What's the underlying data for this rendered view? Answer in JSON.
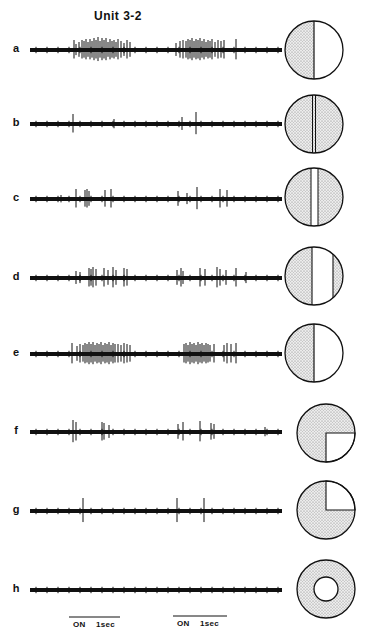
{
  "figure": {
    "title": "Unit 3-2",
    "colors": {
      "ink": "#111111",
      "stipple": "#c9c9c9",
      "background": "#ffffff"
    },
    "rows": [
      {
        "label": "a",
        "y": 50,
        "stimulus": "half-left-shaded",
        "spikes": [
          [
            74,
            10
          ],
          [
            76,
            6
          ],
          [
            79,
            8
          ],
          [
            82,
            10
          ],
          [
            84,
            9
          ],
          [
            86,
            11
          ],
          [
            88,
            8
          ],
          [
            90,
            11
          ],
          [
            92,
            9
          ],
          [
            94,
            12
          ],
          [
            96,
            10
          ],
          [
            98,
            13
          ],
          [
            100,
            9
          ],
          [
            102,
            12
          ],
          [
            104,
            10
          ],
          [
            106,
            12
          ],
          [
            108,
            8
          ],
          [
            110,
            11
          ],
          [
            112,
            9
          ],
          [
            114,
            10
          ],
          [
            116,
            8
          ],
          [
            118,
            11
          ],
          [
            121,
            9
          ],
          [
            124,
            7
          ],
          [
            127,
            10
          ],
          [
            130,
            8
          ],
          [
            176,
            7
          ],
          [
            180,
            9
          ],
          [
            183,
            10
          ],
          [
            186,
            9
          ],
          [
            188,
            11
          ],
          [
            190,
            10
          ],
          [
            192,
            12
          ],
          [
            194,
            9
          ],
          [
            196,
            11
          ],
          [
            198,
            10
          ],
          [
            200,
            12
          ],
          [
            202,
            9
          ],
          [
            204,
            11
          ],
          [
            206,
            8
          ],
          [
            208,
            10
          ],
          [
            210,
            9
          ],
          [
            212,
            11
          ],
          [
            215,
            8
          ],
          [
            218,
            10
          ],
          [
            221,
            9
          ],
          [
            224,
            10
          ],
          [
            236,
            11
          ]
        ]
      },
      {
        "label": "b",
        "y": 124,
        "stimulus": "two-lines-shaded",
        "spikes": [
          [
            73,
            10
          ],
          [
            114,
            5
          ],
          [
            182,
            7
          ],
          [
            196,
            12
          ]
        ]
      },
      {
        "label": "c",
        "y": 199,
        "stimulus": "narrow-white-slit",
        "spikes": [
          [
            61,
            4
          ],
          [
            76,
            10
          ],
          [
            85,
            9
          ],
          [
            87,
            10
          ],
          [
            89,
            8
          ],
          [
            105,
            9
          ],
          [
            111,
            10
          ],
          [
            178,
            8
          ],
          [
            187,
            6
          ],
          [
            197,
            12
          ],
          [
            220,
            10
          ],
          [
            227,
            9
          ]
        ]
      },
      {
        "label": "d",
        "y": 278,
        "stimulus": "wide-white-slit",
        "spikes": [
          [
            76,
            7
          ],
          [
            80,
            6
          ],
          [
            89,
            10
          ],
          [
            91,
            9
          ],
          [
            93,
            11
          ],
          [
            96,
            9
          ],
          [
            104,
            10
          ],
          [
            108,
            8
          ],
          [
            113,
            11
          ],
          [
            116,
            8
          ],
          [
            124,
            10
          ],
          [
            127,
            9
          ],
          [
            177,
            8
          ],
          [
            181,
            10
          ],
          [
            183,
            7
          ],
          [
            200,
            10
          ],
          [
            205,
            9
          ],
          [
            217,
            11
          ],
          [
            220,
            9
          ],
          [
            226,
            8
          ],
          [
            236,
            10
          ],
          [
            246,
            6
          ]
        ]
      },
      {
        "label": "e",
        "y": 354,
        "stimulus": "half-left-shaded",
        "spikes": [
          [
            72,
            11
          ],
          [
            77,
            8
          ],
          [
            80,
            10
          ],
          [
            83,
            9
          ],
          [
            85,
            11
          ],
          [
            87,
            10
          ],
          [
            89,
            12
          ],
          [
            91,
            10
          ],
          [
            93,
            12
          ],
          [
            95,
            9
          ],
          [
            97,
            11
          ],
          [
            99,
            10
          ],
          [
            101,
            12
          ],
          [
            103,
            9
          ],
          [
            105,
            11
          ],
          [
            107,
            10
          ],
          [
            109,
            12
          ],
          [
            111,
            9
          ],
          [
            113,
            11
          ],
          [
            115,
            10
          ],
          [
            118,
            10
          ],
          [
            121,
            9
          ],
          [
            124,
            11
          ],
          [
            127,
            10
          ],
          [
            130,
            9
          ],
          [
            184,
            10
          ],
          [
            186,
            11
          ],
          [
            188,
            9
          ],
          [
            190,
            12
          ],
          [
            192,
            10
          ],
          [
            194,
            11
          ],
          [
            196,
            9
          ],
          [
            198,
            12
          ],
          [
            200,
            10
          ],
          [
            202,
            11
          ],
          [
            204,
            9
          ],
          [
            206,
            11
          ],
          [
            208,
            10
          ],
          [
            210,
            9
          ],
          [
            214,
            10
          ],
          [
            224,
            9
          ],
          [
            227,
            11
          ],
          [
            231,
            10
          ],
          [
            236,
            11
          ]
        ]
      },
      {
        "label": "f",
        "y": 432,
        "stimulus": "quadrant-lower-right-white",
        "spikes": [
          [
            73,
            12
          ],
          [
            76,
            10
          ],
          [
            102,
            10
          ],
          [
            104,
            9
          ],
          [
            109,
            7
          ],
          [
            178,
            8
          ],
          [
            183,
            10
          ],
          [
            200,
            11
          ],
          [
            211,
            9
          ],
          [
            214,
            8
          ],
          [
            265,
            5
          ]
        ]
      },
      {
        "label": "g",
        "y": 511,
        "stimulus": "quadrant-upper-right-white",
        "spikes": [
          [
            83,
            13
          ],
          [
            177,
            13
          ],
          [
            204,
            13
          ]
        ]
      },
      {
        "label": "h",
        "y": 590,
        "stimulus": "annulus-shaded",
        "spikes": []
      }
    ],
    "stimulus_circles": [
      {
        "row": "a",
        "cx": 314,
        "cy": 50,
        "r": 29,
        "description": "left half stippled, right half white, vertical divider"
      },
      {
        "row": "b",
        "cx": 314,
        "cy": 124,
        "r": 29,
        "description": "fully stippled with central double vertical line"
      },
      {
        "row": "c",
        "cx": 314,
        "cy": 197,
        "r": 29,
        "description": "stippled with narrow white vertical slit"
      },
      {
        "row": "d",
        "cx": 314,
        "cy": 276,
        "r": 29,
        "description": "stippled with wide white vertical slit, right of center"
      },
      {
        "row": "e",
        "cx": 314,
        "cy": 353,
        "r": 29,
        "description": "left half stippled, right half white"
      },
      {
        "row": "f",
        "cx": 326,
        "cy": 433,
        "r": 29,
        "description": "stippled with white lower-right quadrant"
      },
      {
        "row": "g",
        "cx": 326,
        "cy": 510,
        "r": 29,
        "description": "stippled with white upper-right quadrant"
      },
      {
        "row": "h",
        "cx": 326,
        "cy": 589,
        "r": 29,
        "inner_r": 12,
        "description": "stippled annulus with white center disc"
      }
    ],
    "time_bars": [
      {
        "x1": 69,
        "x2": 120,
        "y": 617,
        "on_label": "ON",
        "scale_label": "1sec"
      },
      {
        "x1": 173,
        "x2": 227,
        "y": 616,
        "on_label": "ON",
        "scale_label": "1sec"
      }
    ],
    "trace": {
      "x_start": 30,
      "x_end": 282,
      "thickness": 4
    }
  }
}
